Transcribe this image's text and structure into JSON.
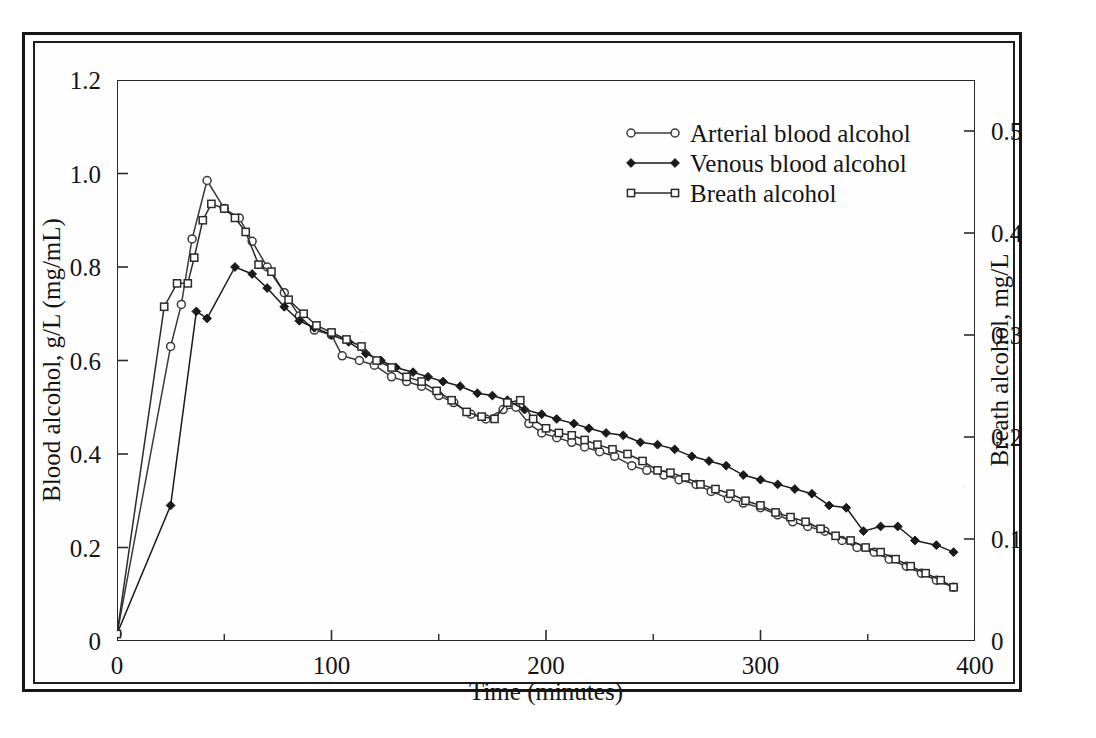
{
  "figure": {
    "frame_style": "double-rule-box",
    "ink_color": "#141414"
  },
  "chart_data": {
    "type": "line",
    "title": "",
    "subtitle": "",
    "xlabel": "Time (minutes)",
    "ylabel": "Blood alcohol, g/L (mg/mL)",
    "ylabel_right": "Breath alcohol, mg/L",
    "xlim": [
      0,
      400
    ],
    "ylim": [
      0,
      1.2
    ],
    "ylim_right": [
      0,
      0.55
    ],
    "grid": false,
    "legend_position": "top-right-inside",
    "xticks": [
      0,
      100,
      200,
      300,
      400
    ],
    "xtick_labels": [
      "0",
      "100",
      "200",
      "300",
      "400"
    ],
    "xminor_ticks": [
      50,
      150,
      250,
      350
    ],
    "yticks": [
      0,
      0.2,
      0.4,
      0.6,
      0.8,
      1.0,
      1.2
    ],
    "ytick_labels": [
      "0",
      "0.2",
      "0.4",
      "0.6",
      "0.8",
      "1.0",
      "1.2"
    ],
    "yticks_right": [
      0,
      0.1,
      0.2,
      0.3,
      0.4,
      0.5
    ],
    "ytick_labels_right": [
      "0",
      "0.1",
      "0.2",
      "0.3",
      "0.4",
      "0.5"
    ],
    "series": [
      {
        "name": "Arterial blood alcohol",
        "marker": "open-circle",
        "axis": "left",
        "color": "#3a3a3a",
        "points": [
          [
            0,
            0.015
          ],
          [
            25,
            0.63
          ],
          [
            30,
            0.72
          ],
          [
            35,
            0.86
          ],
          [
            42,
            0.985
          ],
          [
            50,
            0.925
          ],
          [
            57,
            0.905
          ],
          [
            63,
            0.855
          ],
          [
            70,
            0.8
          ],
          [
            78,
            0.745
          ],
          [
            85,
            0.695
          ],
          [
            92,
            0.665
          ],
          [
            100,
            0.655
          ],
          [
            105,
            0.61
          ],
          [
            113,
            0.6
          ],
          [
            120,
            0.59
          ],
          [
            128,
            0.565
          ],
          [
            135,
            0.555
          ],
          [
            142,
            0.545
          ],
          [
            150,
            0.525
          ],
          [
            157,
            0.51
          ],
          [
            165,
            0.485
          ],
          [
            172,
            0.475
          ],
          [
            180,
            0.495
          ],
          [
            186,
            0.5
          ],
          [
            192,
            0.465
          ],
          [
            198,
            0.445
          ],
          [
            205,
            0.435
          ],
          [
            212,
            0.425
          ],
          [
            218,
            0.415
          ],
          [
            225,
            0.405
          ],
          [
            232,
            0.395
          ],
          [
            240,
            0.375
          ],
          [
            247,
            0.365
          ],
          [
            255,
            0.355
          ],
          [
            262,
            0.345
          ],
          [
            270,
            0.335
          ],
          [
            277,
            0.32
          ],
          [
            285,
            0.305
          ],
          [
            292,
            0.295
          ],
          [
            300,
            0.285
          ],
          [
            308,
            0.27
          ],
          [
            315,
            0.255
          ],
          [
            322,
            0.245
          ],
          [
            330,
            0.235
          ],
          [
            338,
            0.215
          ],
          [
            345,
            0.2
          ],
          [
            353,
            0.19
          ],
          [
            360,
            0.175
          ],
          [
            368,
            0.16
          ],
          [
            375,
            0.145
          ],
          [
            382,
            0.13
          ],
          [
            390,
            0.115
          ]
        ]
      },
      {
        "name": "Venous blood alcohol",
        "marker": "filled-diamond",
        "axis": "left",
        "color": "#1a1a1a",
        "points": [
          [
            0,
            0.015
          ],
          [
            25,
            0.29
          ],
          [
            37,
            0.705
          ],
          [
            42,
            0.69
          ],
          [
            55,
            0.8
          ],
          [
            63,
            0.785
          ],
          [
            70,
            0.755
          ],
          [
            78,
            0.715
          ],
          [
            85,
            0.685
          ],
          [
            92,
            0.67
          ],
          [
            100,
            0.655
          ],
          [
            108,
            0.64
          ],
          [
            116,
            0.615
          ],
          [
            123,
            0.6
          ],
          [
            130,
            0.585
          ],
          [
            138,
            0.575
          ],
          [
            145,
            0.565
          ],
          [
            152,
            0.555
          ],
          [
            160,
            0.545
          ],
          [
            168,
            0.53
          ],
          [
            175,
            0.525
          ],
          [
            182,
            0.515
          ],
          [
            190,
            0.495
          ],
          [
            198,
            0.485
          ],
          [
            205,
            0.475
          ],
          [
            213,
            0.465
          ],
          [
            220,
            0.455
          ],
          [
            228,
            0.445
          ],
          [
            236,
            0.44
          ],
          [
            244,
            0.425
          ],
          [
            252,
            0.42
          ],
          [
            260,
            0.41
          ],
          [
            268,
            0.395
          ],
          [
            276,
            0.385
          ],
          [
            284,
            0.375
          ],
          [
            292,
            0.355
          ],
          [
            300,
            0.345
          ],
          [
            308,
            0.335
          ],
          [
            316,
            0.325
          ],
          [
            324,
            0.315
          ],
          [
            332,
            0.29
          ],
          [
            340,
            0.285
          ],
          [
            348,
            0.235
          ],
          [
            356,
            0.245
          ],
          [
            364,
            0.245
          ],
          [
            372,
            0.215
          ],
          [
            382,
            0.205
          ],
          [
            390,
            0.19
          ]
        ]
      },
      {
        "name": "Breath alcohol",
        "marker": "open-square",
        "axis": "left-scaled",
        "color": "#2a2a2a",
        "points": [
          [
            0,
            0.015
          ],
          [
            22,
            0.715
          ],
          [
            28,
            0.765
          ],
          [
            33,
            0.765
          ],
          [
            36,
            0.82
          ],
          [
            40,
            0.9
          ],
          [
            44,
            0.935
          ],
          [
            50,
            0.925
          ],
          [
            55,
            0.905
          ],
          [
            60,
            0.875
          ],
          [
            66,
            0.805
          ],
          [
            72,
            0.79
          ],
          [
            80,
            0.73
          ],
          [
            87,
            0.7
          ],
          [
            93,
            0.675
          ],
          [
            100,
            0.66
          ],
          [
            107,
            0.645
          ],
          [
            114,
            0.63
          ],
          [
            121,
            0.6
          ],
          [
            128,
            0.585
          ],
          [
            135,
            0.565
          ],
          [
            142,
            0.555
          ],
          [
            149,
            0.535
          ],
          [
            156,
            0.515
          ],
          [
            163,
            0.49
          ],
          [
            170,
            0.48
          ],
          [
            176,
            0.475
          ],
          [
            182,
            0.51
          ],
          [
            188,
            0.515
          ],
          [
            194,
            0.475
          ],
          [
            200,
            0.455
          ],
          [
            206,
            0.445
          ],
          [
            212,
            0.44
          ],
          [
            218,
            0.43
          ],
          [
            224,
            0.42
          ],
          [
            231,
            0.41
          ],
          [
            238,
            0.4
          ],
          [
            245,
            0.385
          ],
          [
            252,
            0.365
          ],
          [
            258,
            0.36
          ],
          [
            265,
            0.35
          ],
          [
            272,
            0.335
          ],
          [
            279,
            0.325
          ],
          [
            286,
            0.315
          ],
          [
            293,
            0.3
          ],
          [
            300,
            0.29
          ],
          [
            307,
            0.275
          ],
          [
            314,
            0.265
          ],
          [
            321,
            0.255
          ],
          [
            328,
            0.24
          ],
          [
            335,
            0.225
          ],
          [
            342,
            0.215
          ],
          [
            349,
            0.2
          ],
          [
            356,
            0.19
          ],
          [
            363,
            0.175
          ],
          [
            370,
            0.16
          ],
          [
            377,
            0.145
          ],
          [
            384,
            0.13
          ],
          [
            390,
            0.115
          ]
        ]
      }
    ],
    "legend": [
      "Arterial blood alcohol",
      "Venous blood alcohol",
      "Breath alcohol"
    ]
  }
}
